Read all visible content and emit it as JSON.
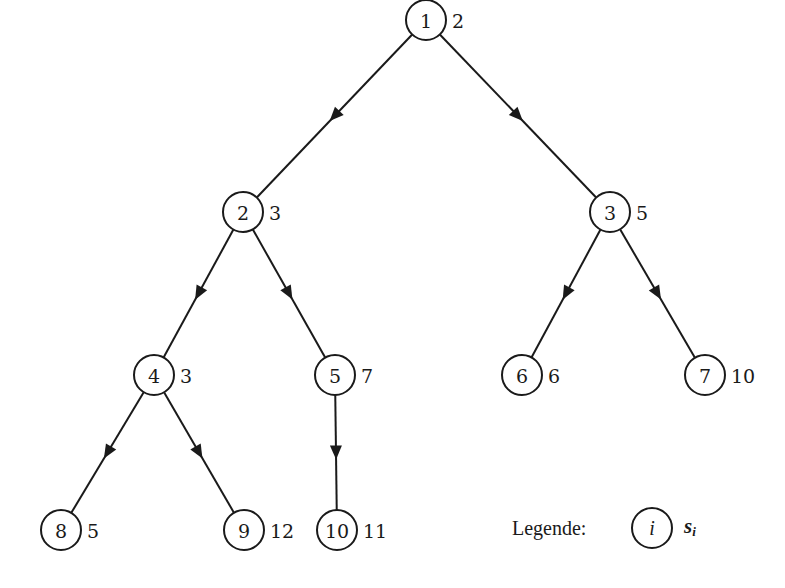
{
  "diagram": {
    "type": "tree",
    "nodes": [
      {
        "id": "1",
        "label": "1",
        "weight": "2",
        "x": 426,
        "y": 20
      },
      {
        "id": "2",
        "label": "2",
        "weight": "3",
        "x": 243,
        "y": 212
      },
      {
        "id": "3",
        "label": "3",
        "weight": "5",
        "x": 610,
        "y": 212
      },
      {
        "id": "4",
        "label": "4",
        "weight": "3",
        "x": 154,
        "y": 375
      },
      {
        "id": "5",
        "label": "5",
        "weight": "7",
        "x": 335,
        "y": 375
      },
      {
        "id": "6",
        "label": "6",
        "weight": "6",
        "x": 522,
        "y": 375
      },
      {
        "id": "7",
        "label": "7",
        "weight": "10",
        "x": 705,
        "y": 375
      },
      {
        "id": "8",
        "label": "8",
        "weight": "5",
        "x": 61,
        "y": 530
      },
      {
        "id": "9",
        "label": "9",
        "weight": "12",
        "x": 244,
        "y": 530
      },
      {
        "id": "10",
        "label": "10",
        "weight": "11",
        "x": 337,
        "y": 530
      }
    ],
    "edges": [
      {
        "from": "1",
        "to": "2"
      },
      {
        "from": "1",
        "to": "3"
      },
      {
        "from": "2",
        "to": "4"
      },
      {
        "from": "2",
        "to": "5"
      },
      {
        "from": "3",
        "to": "6"
      },
      {
        "from": "3",
        "to": "7"
      },
      {
        "from": "4",
        "to": "8"
      },
      {
        "from": "4",
        "to": "9"
      },
      {
        "from": "5",
        "to": "10"
      }
    ],
    "node_radius": 20,
    "colors": {
      "stroke": "#1a1a1a",
      "background": "#ffffff"
    }
  },
  "legend": {
    "title": "Legende:",
    "node_symbol": "i",
    "weight_symbol": "s",
    "weight_subscript": "i"
  }
}
